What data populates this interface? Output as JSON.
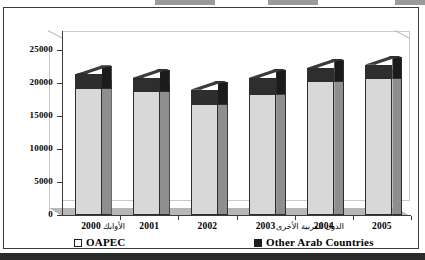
{
  "chart_data": {
    "type": "bar",
    "subtype": "stacked-3d-column",
    "title": "",
    "xlabel": "",
    "ylabel": "",
    "categories": [
      "2000",
      "2001",
      "2002",
      "2003",
      "2004",
      "2005"
    ],
    "series": [
      {
        "name": "OAPEC",
        "name_ar": "الأوابك",
        "color": "#d8d8d8",
        "values": [
          19200,
          18800,
          16800,
          18400,
          20300,
          20800
        ]
      },
      {
        "name": "Other Arab Countries",
        "name_ar": "الدول العربية الأخرى",
        "color": "#2e2e2e",
        "values": [
          2100,
          2000,
          2200,
          2400,
          2000,
          2000
        ]
      }
    ],
    "totals": [
      21300,
      20800,
      19000,
      20800,
      22300,
      22800
    ],
    "ylim": [
      0,
      25000
    ],
    "yticks": [
      0,
      5000,
      10000,
      15000,
      20000,
      25000
    ],
    "ytick_labels": [
      "0",
      "5000",
      "10000",
      "15000",
      "20000",
      "25000"
    ],
    "grid": false,
    "legend_position": "bottom"
  },
  "legend": {
    "oapec_ar": "الأوابك",
    "oapec_en": "OAPEC",
    "other_ar": "الدول العربية الأخرى",
    "other_en": "Other Arab Countries"
  }
}
